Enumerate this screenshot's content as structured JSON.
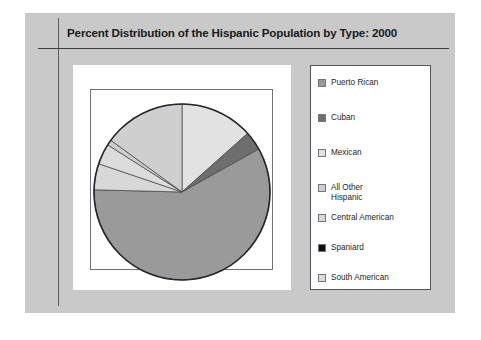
{
  "figure": {
    "title": "Percent Distribution of the Hispanic Population by Type: 2000",
    "background_color": "#c9c9c9",
    "panel_color": "#ffffff",
    "rule_color": "#3a3f45"
  },
  "legend": {
    "position": "right",
    "items": [
      {
        "label": "Puerto Rican",
        "color": "#9a9a9a",
        "swatch_name": "swatch-puerto-rican"
      },
      {
        "label": "Cuban",
        "color": "#6e6e6e",
        "swatch_name": "swatch-cuban"
      },
      {
        "label": "Mexican",
        "color": "#e2e2e2",
        "swatch_name": "swatch-mexican"
      },
      {
        "label": "All Other\nHispanic",
        "color": "#cfcfcf",
        "swatch_name": "swatch-all-other-hispanic"
      },
      {
        "label": "Central American",
        "color": "#d8d8d8",
        "swatch_name": "swatch-central-american"
      },
      {
        "label": "Spaniard",
        "color": "#0d0d0d",
        "swatch_name": "swatch-spaniard"
      },
      {
        "label": "South American",
        "color": "#dcdcdc",
        "swatch_name": "swatch-south-american"
      }
    ]
  },
  "chart_data": {
    "type": "pie",
    "title": "Percent Distribution of the Hispanic Population by Type: 2000",
    "xlabel": "",
    "ylabel": "",
    "units": "percent",
    "start_angle_deg": 90,
    "direction": "clockwise",
    "legend_position": "right",
    "grid": false,
    "categories": [
      "Mexican",
      "Cuban",
      "Puerto Rican",
      "Central American",
      "South American",
      "Spaniard",
      "All Other Hispanic"
    ],
    "values": [
      13.4,
      3.5,
      58.5,
      4.8,
      3.8,
      1.0,
      15.0
    ],
    "slices": [
      {
        "label": "Mexican",
        "value": 13.4,
        "color": "#e2e2e2"
      },
      {
        "label": "Cuban",
        "value": 3.5,
        "color": "#6e6e6e"
      },
      {
        "label": "Puerto Rican",
        "value": 58.5,
        "color": "#9a9a9a"
      },
      {
        "label": "Central American",
        "value": 4.8,
        "color": "#d8d8d8"
      },
      {
        "label": "South American",
        "value": 3.8,
        "color": "#dcdcdc"
      },
      {
        "label": "Spaniard",
        "value": 1.0,
        "color": "#cdcdcd"
      },
      {
        "label": "All Other Hispanic",
        "value": 15.0,
        "color": "#cfcfcf"
      }
    ]
  }
}
